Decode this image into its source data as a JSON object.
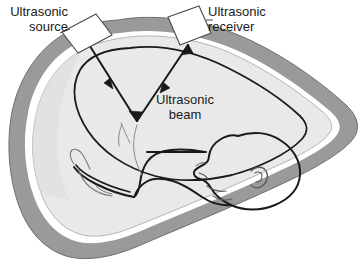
{
  "figure": {
    "background_color": "#ffffff"
  },
  "labels": {
    "source": "Ultrasonic\nsource",
    "receiver": "Ultrasonic\nreceiver",
    "beam": "Ultrasonic\nbeam"
  },
  "colors": {
    "outline": "#1a1a1a",
    "outer_band": "#9a9a9a",
    "white_gap": "#ffffff",
    "interior": "#e9e9e9",
    "interior_shade": "#dedede",
    "transducer_fill": "#ffffff",
    "text": "#1a1a1a"
  },
  "elements": {
    "abdomen_label": "maternal abdomen wall",
    "uterus_label": "uterus outline",
    "fetus_label": "fetus profile",
    "source_transducer_label": "ultrasonic source transducer",
    "receiver_transducer_label": "ultrasonic receiver transducer",
    "beam_incident_label": "incident ultrasonic beam path",
    "beam_reflected_label": "reflected ultrasonic beam path"
  }
}
